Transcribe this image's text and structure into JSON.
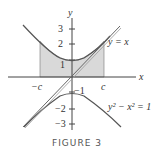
{
  "figure": {
    "caption": "FIGURE 3",
    "axes": {
      "x_label": "x",
      "y_label": "y",
      "y_ticks": [
        "3",
        "2",
        "1",
        "−1",
        "−2",
        "−3"
      ],
      "x_ticks": [
        "−c",
        "c"
      ]
    },
    "curves": {
      "asymptote_label": "y = x",
      "hyperbola_label": "y² − x² = 1"
    },
    "colors": {
      "curve": "#555555",
      "shade": "#d9d9d9",
      "axis": "#444444"
    }
  }
}
